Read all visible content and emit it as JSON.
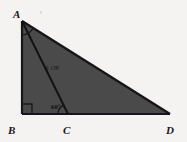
{
  "figure": {
    "type": "geometry-diagram",
    "background_color": "#f4f3f1",
    "fill_color": "#4a4a4a",
    "stroke_color": "#16161a",
    "vertices": {
      "A": {
        "label": "A",
        "x": 22,
        "y": 21
      },
      "B": {
        "label": "B",
        "x": 22,
        "y": 114
      },
      "C": {
        "label": "C",
        "x": 68,
        "y": 114
      },
      "D": {
        "label": "D",
        "x": 170,
        "y": 114
      }
    },
    "segments": [
      {
        "name": "AB",
        "from": "A",
        "to": "B"
      },
      {
        "name": "BD",
        "from": "B",
        "to": "D"
      },
      {
        "name": "AD",
        "from": "A",
        "to": "D"
      },
      {
        "name": "AC",
        "from": "A",
        "to": "C"
      }
    ],
    "labels": {
      "side_ac": "6 cm",
      "angle_c": "60°"
    },
    "markers": {
      "right_angle_at_b": true,
      "angle_arc_at_a": true,
      "angle_arc_at_c": true
    }
  }
}
